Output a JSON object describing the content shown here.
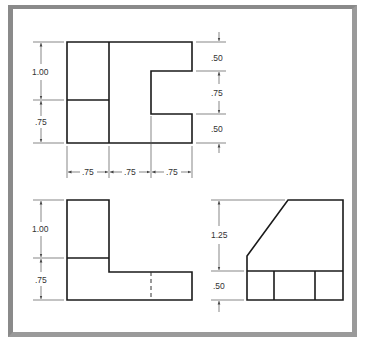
{
  "figure": {
    "views": {
      "top": {
        "left_dims": [
          "1.00",
          ".75"
        ],
        "right_dims": [
          ".50",
          ".75",
          ".50"
        ],
        "bottom_dims": [
          ".75",
          ".75",
          ".75"
        ]
      },
      "front": {
        "left_dims": [
          "1.00",
          ".75"
        ]
      },
      "side": {
        "left_dims": [
          "1.25",
          ".50"
        ]
      }
    }
  },
  "colors": {
    "frame": "#8a8a8a",
    "object_line": "#1a1a1a",
    "dimension_line": "#555555"
  }
}
